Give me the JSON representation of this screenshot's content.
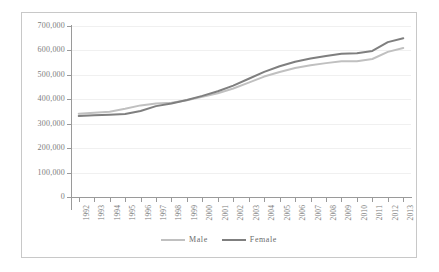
{
  "chart_data": {
    "type": "line",
    "title": "",
    "xlabel": "",
    "ylabel": "",
    "ylim": [
      0,
      700000
    ],
    "grid": true,
    "legend_position": "bottom-center",
    "categories": [
      "1992",
      "1993",
      "1994",
      "1995",
      "1996",
      "1997",
      "1998",
      "1999",
      "2000",
      "2001",
      "2002",
      "2003",
      "2004",
      "2005",
      "2006",
      "2007",
      "2008",
      "2009",
      "2010",
      "2011",
      "2012",
      "2013"
    ],
    "y_ticks": [
      0,
      100000,
      200000,
      300000,
      400000,
      500000,
      600000,
      700000
    ],
    "y_tick_labels": [
      "0",
      "100,000",
      "200,000",
      "300,000",
      "400,000",
      "500,000",
      "600,000",
      "700,000"
    ],
    "series": [
      {
        "name": "Male",
        "color": "#c0c0c0",
        "values": [
          341000,
          345000,
          349000,
          361000,
          375000,
          383000,
          386000,
          396000,
          410000,
          425000,
          444000,
          468000,
          493000,
          512000,
          528000,
          539000,
          548000,
          556000,
          556000,
          565000,
          594000,
          610000
        ]
      },
      {
        "name": "Female",
        "color": "#7f7f7f",
        "values": [
          332000,
          335000,
          337000,
          340000,
          352000,
          372000,
          383000,
          397000,
          414000,
          433000,
          456000,
          484000,
          512000,
          535000,
          554000,
          567000,
          577000,
          586000,
          588000,
          598000,
          634000,
          650000
        ]
      }
    ]
  },
  "legend": {
    "items": [
      {
        "label": "Male",
        "color": "#c0c0c0"
      },
      {
        "label": "Female",
        "color": "#7f7f7f"
      }
    ]
  }
}
